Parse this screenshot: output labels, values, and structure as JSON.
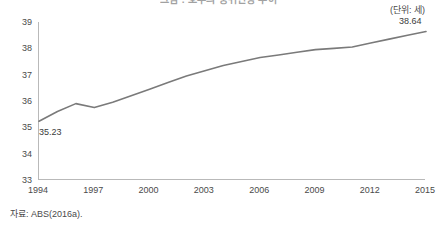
{
  "unit_label": "(단위: 세)",
  "source_note": "자료: ABS(2016a).",
  "title": "그림 : 호주의 중위연령 추이",
  "colors": {
    "line": "#7a7a7a",
    "axis": "#b9b9b9",
    "text": "#4a4a4a"
  },
  "labels": {
    "first_point": "35.23",
    "last_point": "38.64"
  },
  "chart_data": {
    "type": "line",
    "title": "그림 : 호주의 중위연령 추이",
    "xlabel": "",
    "ylabel": "",
    "unit": "세",
    "grid": false,
    "legend": "none",
    "ylim": [
      33,
      39
    ],
    "yticks": [
      33,
      34,
      35,
      36,
      37,
      38,
      39
    ],
    "xlim": [
      1994,
      2015
    ],
    "xticks": [
      1994,
      1997,
      2000,
      2003,
      2006,
      2009,
      2012,
      2015
    ],
    "x": [
      1994,
      1995,
      1996,
      1997,
      1998,
      1999,
      2000,
      2001,
      2002,
      2003,
      2004,
      2005,
      2006,
      2007,
      2008,
      2009,
      2010,
      2011,
      2012,
      2013,
      2014,
      2015
    ],
    "values": [
      35.23,
      35.6,
      35.9,
      35.75,
      35.95,
      36.2,
      36.45,
      36.7,
      36.95,
      37.15,
      37.35,
      37.5,
      37.65,
      37.75,
      37.85,
      37.95,
      38.0,
      38.05,
      38.2,
      38.35,
      38.5,
      38.64
    ],
    "annotations": [
      {
        "x": 1994,
        "y": 35.23,
        "text": "35.23"
      },
      {
        "x": 2015,
        "y": 38.64,
        "text": "38.64"
      }
    ],
    "source": "자료: ABS(2016a)."
  }
}
